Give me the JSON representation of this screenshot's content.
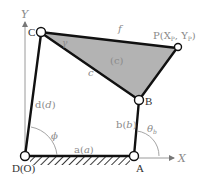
{
  "diagram": {
    "axes": {
      "x_label": "X",
      "y_label": "Y"
    },
    "joints": {
      "D": {
        "label": "D(O)"
      },
      "A": {
        "label": "A"
      },
      "B": {
        "label": "B"
      },
      "C": {
        "label": "C"
      },
      "P": {
        "label": "P(X",
        "label_sub1": "P",
        "label_mid": ", Y",
        "label_sub2": "P",
        "label_end": ")"
      }
    },
    "links": {
      "a": {
        "label": "a(",
        "italic": "a",
        "close": ")"
      },
      "b": {
        "label": "b(",
        "italic": "b",
        "close": ")"
      },
      "d": {
        "label": "d(",
        "italic": "d",
        "close": ")"
      },
      "c": {
        "label": "c"
      },
      "f": {
        "label": "f"
      }
    },
    "coupler": {
      "label": "(c)",
      "angle_label": "γ"
    },
    "angles": {
      "phi": {
        "label": "ϕ"
      },
      "theta_b": {
        "label": "θ",
        "sub": "b"
      }
    },
    "colors": {
      "coupler_fill": "#b3b3b3",
      "link": "#111111",
      "label": "#8a8a8a"
    }
  }
}
